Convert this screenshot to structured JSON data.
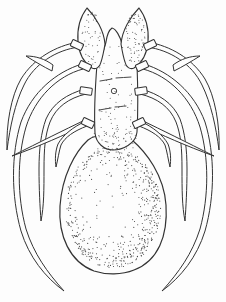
{
  "canvas": {
    "width": 226,
    "height": 302,
    "background": "#fdfdfd",
    "line_color": "#333333",
    "stipple_color": "#474747"
  },
  "paths": [
    {
      "name": "leg-left-1",
      "sw": 1.0,
      "d": "M 78,42 C 56,46 34,58 21,79 C 11,96 6,125 7,150 C 10,127 15,103 24,85 C 34,64 56,50 79,47 Z"
    },
    {
      "name": "leg-left-2",
      "sw": 1.0,
      "d": "M 82,64 C 56,72 32,92 21,122 C 11,154 11,196 21,231 C 29,257 45,277 64,291 C 47,272 34,254 26,229 C 17,196 17,158 26,127 C 35,98 57,76 83,69 Z"
    },
    {
      "name": "leg-left-3",
      "sw": 1.0,
      "d": "M 85,89 C 67,94 53,103 46,119 C 41,133 39,149 39,169 C 39,189 40,207 41,221 C 44,206 44,189 44,169 C 44,149 45,135 50,122 C 56,107 69,98 86,94 Z"
    },
    {
      "name": "leg-left-5-diagonal",
      "sw": 1.0,
      "d": "M 85,120 C 64,130 40,142 12,156 C 40,146 64,135 86,125 Z"
    },
    {
      "name": "leg-left-4",
      "sw": 1.0,
      "d": "M 86,121 C 73,127 63,135 58,144 C 55,152 55,160 56,167 C 58,159 59,151 61,145 C 65,137 74,131 87,126 Z"
    },
    {
      "name": "leg-right-1",
      "sw": 1.0,
      "d": "M 148,42 C 170,46 192,58 205,79 C 215,96 220,125 219,150 C 216,127 211,103 202,85 C 192,64 170,50 147,47 Z"
    },
    {
      "name": "leg-right-2",
      "sw": 1.0,
      "d": "M 144,64 C 170,72 194,92 205,122 C 215,154 215,196 205,231 C 197,257 181,277 162,291 C 179,272 192,254 200,229 C 209,196 209,158 200,127 C 191,98 169,76 143,69 Z"
    },
    {
      "name": "leg-right-3",
      "sw": 1.0,
      "d": "M 141,89 C 159,94 173,103 180,119 C 185,133 187,149 187,169 C 187,189 186,207 185,221 C 182,206 182,189 182,169 C 182,149 181,135 176,122 C 170,107 157,98 140,94 Z"
    },
    {
      "name": "leg-right-5-diagonal",
      "sw": 1.0,
      "d": "M 141,120 C 162,130 186,142 214,156 C 186,146 162,135 140,125 Z"
    },
    {
      "name": "leg-right-4",
      "sw": 1.0,
      "d": "M 140,121 C 153,127 163,135 168,144 C 171,152 171,160 170,167 C 168,159 167,151 165,145 C 161,137 152,131 139,126 Z"
    },
    {
      "name": "spine-left",
      "sw": 1.0,
      "d": "M 53,65 C 45,59 36,56 26,56 C 34,61 44,67 52,71 Z"
    },
    {
      "name": "spine-right",
      "sw": 1.0,
      "d": "M 173,65 C 181,59 190,56 200,56 C 192,61 182,67 174,71 Z"
    },
    {
      "name": "abdomen",
      "sw": 1.2,
      "d": "M 88,140 C 96,133 130,133 132,140 C 146,152 164,175 166,205 C 168,236 158,261 134,270 C 122,275 106,275 94,271 C 70,262 58,236 60,206 C 62,176 75,152 88,140 Z"
    },
    {
      "name": "trunk",
      "sw": 1.1,
      "d": "M 97,64 C 95,90 94,114 95,133 C 96,143 104,150 113,150 C 122,150 136,144 137,132 C 138,114 138,90 137,64 C 131,59 125,52 122,44 C 120,36 116,29 112,28 C 109,30 107,35 106,42 C 104,50 101,58 97,64 Z"
    },
    {
      "name": "ear-left",
      "sw": 1.1,
      "d": "M 87,8 C 80,17 77,30 78,42 C 79,53 84,63 92,68 C 96,70 100,67 101,62 C 103,56 104,50 105,44 C 104,31 96,17 87,8 Z"
    },
    {
      "name": "ear-right",
      "sw": 1.1,
      "d": "M 139,8 C 146,17 149,30 148,42 C 147,53 142,63 134,68 C 130,70 126,67 125,62 C 123,56 122,50 121,44 C 122,31 130,17 139,8 Z"
    }
  ],
  "bands": [
    {
      "name": "coxa-band-left-1",
      "cx": 77,
      "cy": 45,
      "w": 12,
      "h": 7,
      "angle": 25
    },
    {
      "name": "coxa-band-left-2",
      "cx": 85,
      "cy": 66,
      "w": 12,
      "h": 7,
      "angle": 25
    },
    {
      "name": "coxa-band-left-3",
      "cx": 86,
      "cy": 91,
      "w": 12,
      "h": 7,
      "angle": 8
    },
    {
      "name": "coxa-band-left-4",
      "cx": 88,
      "cy": 123,
      "w": 12,
      "h": 7,
      "angle": 25
    },
    {
      "name": "coxa-band-right-1",
      "cx": 150,
      "cy": 45,
      "w": 12,
      "h": 7,
      "angle": -25
    },
    {
      "name": "coxa-band-right-2",
      "cx": 142,
      "cy": 66,
      "w": 12,
      "h": 7,
      "angle": -25
    },
    {
      "name": "coxa-band-right-3",
      "cx": 141,
      "cy": 91,
      "w": 12,
      "h": 7,
      "angle": -8
    },
    {
      "name": "coxa-band-right-4",
      "cx": 139,
      "cy": 123,
      "w": 12,
      "h": 7,
      "angle": -25
    }
  ],
  "marks": {
    "dashes": [
      "M 100,81 C 104,80 108,80 112,79",
      "M 116,78 C 121,78 126,77 131,77",
      "M 99,110 C 103,109 107,109 111,108",
      "M 115,107 C 119,107 123,106 126,106"
    ],
    "circle": {
      "cx": 114,
      "cy": 91,
      "r": 2.7
    }
  },
  "stipple": [
    {
      "name": "abdomen-stipple",
      "type": "ellipse",
      "cx": 113,
      "cy": 208,
      "rx": 48,
      "ry": 60,
      "n": 1600,
      "mode": "ring-rb",
      "seed": 7,
      "r": 0.55
    },
    {
      "name": "trunk-stipple",
      "type": "rect",
      "x": 99,
      "y": 46,
      "w": 36,
      "h": 100,
      "n": 230,
      "mode": "scatter",
      "seed": 11,
      "r": 0.5
    },
    {
      "name": "trunk-bottom-stipple",
      "type": "rect",
      "x": 92,
      "y": 128,
      "w": 44,
      "h": 26,
      "n": 150,
      "mode": "scatter",
      "seed": 13,
      "r": 0.5
    },
    {
      "name": "ear-left-stipple",
      "type": "ellipse",
      "cx": 91,
      "cy": 38,
      "rx": 10,
      "ry": 27,
      "n": 150,
      "mode": "scatter",
      "seed": 3,
      "r": 0.5
    },
    {
      "name": "ear-right-stipple",
      "type": "ellipse",
      "cx": 135,
      "cy": 38,
      "rx": 10,
      "ry": 27,
      "n": 150,
      "mode": "scatter",
      "seed": 5,
      "r": 0.5
    }
  ]
}
